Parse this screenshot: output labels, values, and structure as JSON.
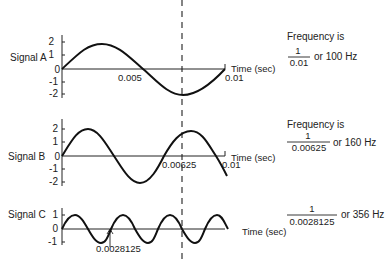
{
  "time_axis_label": "Time (sec)",
  "marker_line": {
    "style": "dashed",
    "x_time": 0.00625
  },
  "signals": [
    {
      "name": "Signal A",
      "y_ticks": [
        "2",
        "1",
        "0",
        "-1",
        "-2"
      ],
      "x_labels": [
        "0.005",
        "0.01"
      ],
      "period": 0.01,
      "amplitude": 1.9,
      "freq_title": "Frequency is",
      "freq_numerator": "1",
      "freq_denominator": "0.01",
      "freq_result": "or 100 Hz"
    },
    {
      "name": "Signal B",
      "y_ticks": [
        "2",
        "1",
        "0",
        "-1",
        "-2"
      ],
      "x_labels": [
        "0.00625",
        "0.01"
      ],
      "period": 0.00625,
      "amplitude": 2,
      "freq_title": "Frequency is",
      "freq_numerator": "1",
      "freq_denominator": "0.00625",
      "freq_result": "or 160 Hz"
    },
    {
      "name": "Signal C",
      "y_ticks": [
        "1",
        "0",
        "-1"
      ],
      "x_labels": [
        "0.0028125"
      ],
      "period": 0.0028125,
      "amplitude": 1,
      "freq_numerator": "1",
      "freq_denominator": "0.0028125",
      "freq_result": "or 356 Hz"
    }
  ]
}
